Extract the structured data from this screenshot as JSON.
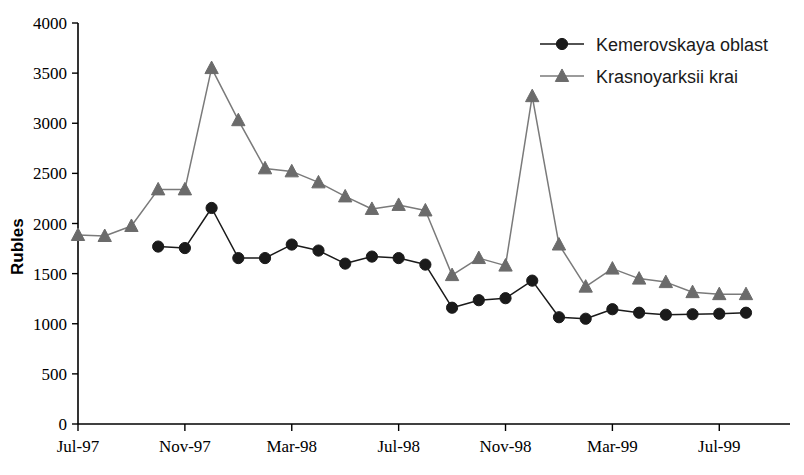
{
  "chart_data": {
    "type": "line",
    "title": "",
    "subtitle": "",
    "xlabel": "",
    "ylabel": "Rubles",
    "ylim": [
      0,
      4000
    ],
    "ytick_step": 500,
    "yticks": [
      "0",
      "500",
      "1000",
      "1500",
      "2000",
      "2500",
      "3000",
      "3500",
      "4000"
    ],
    "grid": false,
    "legend_position": "top-right",
    "xticks": [
      "Jul-97",
      "Nov-97",
      "Mar-98",
      "Jul-98",
      "Nov-98",
      "Mar-99",
      "Jul-99"
    ],
    "xtick_months": [
      0,
      4,
      8,
      12,
      16,
      20,
      24
    ],
    "x": [
      "Jul-97",
      "Aug-97",
      "Sep-97",
      "Oct-97",
      "Nov-97",
      "Dec-97",
      "Jan-98",
      "Feb-98",
      "Mar-98",
      "Apr-98",
      "May-98",
      "Jun-98",
      "Jul-98",
      "Aug-98",
      "Sep-98",
      "Oct-98",
      "Nov-98",
      "Dec-98",
      "Jan-99",
      "Feb-99",
      "Mar-99",
      "Apr-99",
      "May-99",
      "Jun-99",
      "Jul-99",
      "Aug-99"
    ],
    "series": [
      {
        "name": "Kemerovskaya oblast",
        "marker": "circle",
        "color": "#1a1a1a",
        "line_color": "#1a1a1a",
        "start_month": 3,
        "values": [
          null,
          null,
          null,
          1770,
          1755,
          2155,
          1655,
          1655,
          1790,
          1730,
          1600,
          1670,
          1655,
          1590,
          1160,
          1235,
          1255,
          1430,
          1065,
          1050,
          1145,
          1110,
          1090,
          1095,
          1100,
          1110
        ]
      },
      {
        "name": "Krasnoyarksii krai",
        "marker": "triangle",
        "color": "#6b6b6b",
        "line_color": "#7a7a7a",
        "start_month": 0,
        "values": [
          1885,
          1875,
          1975,
          2340,
          2340,
          3550,
          3030,
          2550,
          2520,
          2410,
          2270,
          2145,
          2185,
          2130,
          1485,
          1655,
          1580,
          3270,
          1790,
          1370,
          1550,
          1450,
          1415,
          1315,
          1295,
          1295
        ]
      }
    ],
    "legend": [
      {
        "label": "Kemerovskaya oblast",
        "marker": "circle",
        "color": "#1a1a1a"
      },
      {
        "label": "Krasnoyarksii krai",
        "marker": "triangle",
        "color": "#6b6b6b"
      }
    ]
  }
}
